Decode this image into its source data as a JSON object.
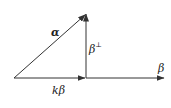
{
  "diagram": {
    "type": "vector-decomposition",
    "colors": {
      "line": "#333333",
      "text": "#222222",
      "background": "#ffffff"
    },
    "points": {
      "origin": [
        14,
        78
      ],
      "foot": [
        86,
        78
      ],
      "alpha_tip": [
        86,
        14
      ],
      "beta_tip": [
        164,
        78
      ]
    },
    "vectors": [
      {
        "id": "alpha",
        "from": "origin",
        "to": "alpha_tip",
        "label": "α"
      },
      {
        "id": "k-beta",
        "from": "origin",
        "to": "foot",
        "label": "kβ"
      },
      {
        "id": "beta-perp",
        "from": "foot",
        "to": "alpha_tip",
        "label": "β⊥"
      },
      {
        "id": "beta",
        "from": "foot",
        "to": "beta_tip",
        "label": "β"
      }
    ],
    "labels": {
      "alpha": "α",
      "beta_perp_base": "β",
      "beta_perp_sup": "⊥",
      "k_beta": "kβ",
      "beta": "β"
    }
  }
}
